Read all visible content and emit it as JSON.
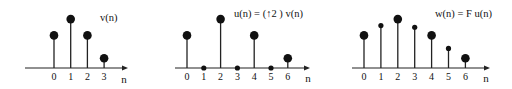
{
  "chart_data": [
    {
      "type": "stem",
      "title": "v(n)",
      "xlabel": "n",
      "categories": [
        "0",
        "1",
        "2",
        "3"
      ],
      "values": [
        2,
        3,
        2,
        0.6
      ],
      "marker_size": [
        "large",
        "large",
        "large",
        "large"
      ]
    },
    {
      "type": "stem",
      "title": "u(n) = (↑2 ) v(n)",
      "xlabel": "n",
      "categories": [
        "0",
        "1",
        "2",
        "3",
        "4",
        "5",
        "6"
      ],
      "values": [
        2,
        0,
        3,
        0,
        2,
        0,
        0.6
      ],
      "marker_size": [
        "large",
        "small",
        "large",
        "small",
        "large",
        "small",
        "large"
      ]
    },
    {
      "type": "stem",
      "title": "w(n) = F u(n)",
      "xlabel": "n",
      "categories": [
        "0",
        "1",
        "2",
        "3",
        "4",
        "5",
        "6"
      ],
      "values": [
        2,
        2.6,
        3,
        2.5,
        2,
        1.2,
        0.6
      ],
      "marker_size": [
        "large",
        "small",
        "large",
        "small",
        "large",
        "small",
        "large"
      ]
    }
  ],
  "panels": [
    {
      "title": "v(n)",
      "xlabel": "n",
      "ticks": [
        "0",
        "1",
        "2",
        "3"
      ]
    },
    {
      "title": "u(n) = (↑2 ) v(n)",
      "xlabel": "n",
      "ticks": [
        "0",
        "1",
        "2",
        "3",
        "4",
        "5",
        "6"
      ]
    },
    {
      "title": "w(n) = F u(n)",
      "xlabel": "n",
      "ticks": [
        "0",
        "1",
        "2",
        "3",
        "4",
        "5",
        "6"
      ]
    }
  ]
}
